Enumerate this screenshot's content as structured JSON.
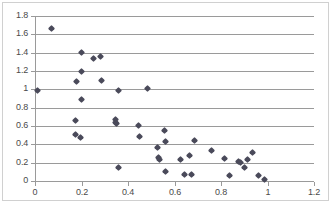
{
  "chart_data": {
    "type": "scatter",
    "title": "",
    "xlabel": "",
    "ylabel": "",
    "xlim": [
      0,
      1.2
    ],
    "ylim": [
      0,
      1.8
    ],
    "grid": true,
    "legend": "none",
    "series_name": "Series 1",
    "marker": "diamond",
    "marker_color": "#4a4a5a",
    "xticks": [
      "0",
      "0.2",
      "0.4",
      "0.6",
      "0.8",
      "1",
      "1.2"
    ],
    "xtick_values": [
      0,
      0.2,
      0.4,
      0.6,
      0.8,
      1.0,
      1.2
    ],
    "yticks": [
      "0",
      "0.2",
      "0.4",
      "0.6",
      "0.8",
      "1",
      "1.2",
      "1.4",
      "1.6",
      "1.8"
    ],
    "ytick_values": [
      0,
      0.2,
      0.4,
      0.6,
      0.8,
      1.0,
      1.2,
      1.4,
      1.6,
      1.8
    ],
    "points": [
      {
        "x": 0.01,
        "y": 0.99
      },
      {
        "x": 0.07,
        "y": 1.66
      },
      {
        "x": 0.18,
        "y": 1.09
      },
      {
        "x": 0.175,
        "y": 0.665
      },
      {
        "x": 0.175,
        "y": 0.505
      },
      {
        "x": 0.195,
        "y": 0.47
      },
      {
        "x": 0.2,
        "y": 1.4
      },
      {
        "x": 0.2,
        "y": 1.2
      },
      {
        "x": 0.2,
        "y": 0.89
      },
      {
        "x": 0.25,
        "y": 1.335
      },
      {
        "x": 0.28,
        "y": 1.36
      },
      {
        "x": 0.285,
        "y": 1.095
      },
      {
        "x": 0.345,
        "y": 0.675
      },
      {
        "x": 0.345,
        "y": 0.635
      },
      {
        "x": 0.35,
        "y": 0.625
      },
      {
        "x": 0.36,
        "y": 0.985
      },
      {
        "x": 0.36,
        "y": 0.145
      },
      {
        "x": 0.445,
        "y": 0.605
      },
      {
        "x": 0.45,
        "y": 0.49
      },
      {
        "x": 0.485,
        "y": 1.01
      },
      {
        "x": 0.525,
        "y": 0.37
      },
      {
        "x": 0.53,
        "y": 0.255
      },
      {
        "x": 0.535,
        "y": 0.24
      },
      {
        "x": 0.555,
        "y": 0.555
      },
      {
        "x": 0.56,
        "y": 0.43
      },
      {
        "x": 0.56,
        "y": 0.1
      },
      {
        "x": 0.625,
        "y": 0.235
      },
      {
        "x": 0.645,
        "y": 0.07
      },
      {
        "x": 0.665,
        "y": 0.275
      },
      {
        "x": 0.675,
        "y": 0.07
      },
      {
        "x": 0.685,
        "y": 0.44
      },
      {
        "x": 0.76,
        "y": 0.335
      },
      {
        "x": 0.815,
        "y": 0.25
      },
      {
        "x": 0.835,
        "y": 0.055
      },
      {
        "x": 0.875,
        "y": 0.215
      },
      {
        "x": 0.885,
        "y": 0.205
      },
      {
        "x": 0.9,
        "y": 0.15
      },
      {
        "x": 0.915,
        "y": 0.235
      },
      {
        "x": 0.935,
        "y": 0.31
      },
      {
        "x": 0.96,
        "y": 0.055
      },
      {
        "x": 0.985,
        "y": 0.015
      }
    ]
  }
}
